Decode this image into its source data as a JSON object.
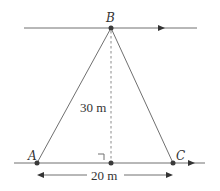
{
  "diagram": {
    "points": {
      "A": "A",
      "B": "B",
      "C": "C"
    },
    "height_label": "30 m",
    "base_label": "20 m",
    "right_angle": true,
    "colors": {
      "line": "#707070",
      "point": "#3a3a3a",
      "text": "#333333"
    }
  }
}
